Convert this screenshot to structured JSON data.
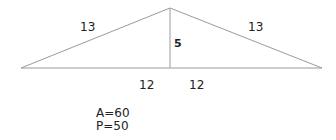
{
  "diagram": {
    "shape": "isosceles-triangle",
    "labels": {
      "left_side": "13",
      "right_side": "13",
      "height": "5",
      "base_left": "12",
      "base_right": "12"
    },
    "results": {
      "area": "A=60",
      "perimeter": "P=50"
    },
    "colors": {
      "line": "#9a9a9a",
      "text": "#222222"
    }
  }
}
